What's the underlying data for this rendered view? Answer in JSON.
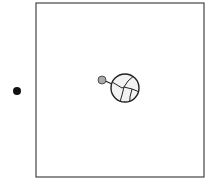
{
  "diagram": {
    "background": "#ffffff",
    "frame": {
      "x": 36,
      "y": 3,
      "width": 168,
      "height": 174,
      "stroke": "#444444",
      "stroke_width": 1.2
    },
    "outside_dot": {
      "cx": 17,
      "cy": 91,
      "r": 4,
      "fill": "#111111"
    },
    "small_node": {
      "cx": 102,
      "cy": 80,
      "r": 4,
      "fill": "#aaaaaa",
      "stroke": "#333333"
    },
    "large_node": {
      "cx": 125,
      "cy": 88,
      "r": 14,
      "fill": "#f2f2f2",
      "stroke": "#222222"
    },
    "connector_color": "#222222"
  }
}
